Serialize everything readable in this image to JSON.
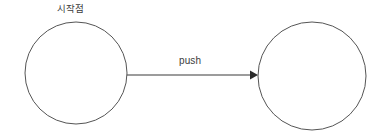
{
  "diagram": {
    "type": "state-transition-graph",
    "background_color": "#ffffff",
    "stroke_color": "#555555",
    "text_color": "#3c3c3c",
    "arrow_color": "#2b2b2b",
    "nodes": [
      {
        "id": "start-node",
        "label": "시작점",
        "label_position": "above",
        "cx": 76,
        "cy": 73,
        "r": 51,
        "fill": "#ffffff"
      },
      {
        "id": "target-node",
        "label": "",
        "label_position": "none",
        "cx": 312,
        "cy": 76,
        "r": 54,
        "fill": "#ffffff"
      }
    ],
    "edges": [
      {
        "id": "push-edge",
        "label": "push",
        "from": "start-node",
        "to": "target-node",
        "direction": "right",
        "x1": 127,
        "y1": 75,
        "x2": 257,
        "y2": 75,
        "arrowhead": "filled-triangle"
      }
    ]
  }
}
